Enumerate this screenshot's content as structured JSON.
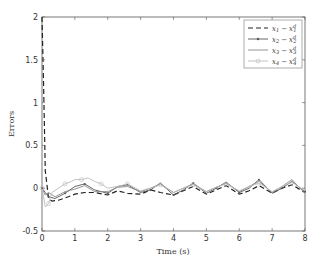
{
  "chart_data": {
    "type": "line",
    "title": "",
    "xlabel": "Time (s)",
    "ylabel": "Errors",
    "xlim": [
      0,
      8
    ],
    "ylim": [
      -0.5,
      2
    ],
    "xticks": [
      0,
      1,
      2,
      3,
      4,
      5,
      6,
      7,
      8
    ],
    "yticks": [
      -0.5,
      0,
      0.5,
      1,
      1.5,
      2
    ],
    "grid": false,
    "legend_position": "upper right",
    "series": [
      {
        "name": "x1 - x1^d",
        "style": "dashed",
        "color": "#222222",
        "x": [
          0,
          0.05,
          0.1,
          0.2,
          0.3,
          0.5,
          0.8,
          1.0,
          1.3,
          1.6,
          2.0,
          2.3,
          2.6,
          3.0,
          3.3,
          3.6,
          4.0,
          4.3,
          4.6,
          5.0,
          5.3,
          5.6,
          6.0,
          6.3,
          6.6,
          7.0,
          7.3,
          7.6,
          8.0
        ],
        "y": [
          2.0,
          1.2,
          0.2,
          -0.12,
          -0.15,
          -0.14,
          -0.1,
          -0.07,
          -0.05,
          -0.05,
          -0.08,
          -0.03,
          -0.06,
          -0.07,
          -0.02,
          -0.05,
          -0.08,
          -0.03,
          0.02,
          -0.07,
          -0.02,
          0.03,
          -0.07,
          -0.03,
          0.03,
          -0.06,
          0.0,
          0.04,
          -0.05
        ]
      },
      {
        "name": "x2 - x2^d",
        "style": "solid-marker",
        "color": "#555555",
        "x": [
          0,
          0.1,
          0.2,
          0.4,
          0.7,
          1.0,
          1.3,
          1.6,
          2.0,
          2.3,
          2.6,
          3.0,
          3.3,
          3.6,
          4.0,
          4.3,
          4.6,
          5.0,
          5.3,
          5.6,
          6.0,
          6.3,
          6.6,
          7.0,
          7.3,
          7.6,
          8.0
        ],
        "y": [
          0.0,
          -0.05,
          -0.1,
          -0.12,
          -0.06,
          0.02,
          0.05,
          -0.02,
          -0.06,
          0.02,
          0.04,
          -0.05,
          -0.02,
          0.06,
          -0.08,
          -0.02,
          0.06,
          -0.06,
          0.0,
          0.07,
          -0.05,
          0.0,
          0.1,
          -0.06,
          0.0,
          0.08,
          -0.04
        ]
      },
      {
        "name": "x3 - x3^d",
        "style": "solid",
        "color": "#888888",
        "x": [
          0,
          0.1,
          0.2,
          0.4,
          0.7,
          1.0,
          1.3,
          1.6,
          2.0,
          2.3,
          2.6,
          3.0,
          3.3,
          3.6,
          4.0,
          4.3,
          4.6,
          5.0,
          5.3,
          5.6,
          6.0,
          6.3,
          6.6,
          7.0,
          7.3,
          7.6,
          8.0
        ],
        "y": [
          0.0,
          -0.08,
          -0.05,
          -0.1,
          -0.04,
          -0.01,
          0.03,
          -0.04,
          -0.04,
          0.01,
          0.02,
          -0.04,
          0.0,
          0.05,
          -0.05,
          0.0,
          0.05,
          -0.04,
          0.01,
          0.06,
          -0.04,
          0.02,
          0.08,
          -0.05,
          0.02,
          0.1,
          -0.06
        ]
      },
      {
        "name": "x4 - x4^d",
        "style": "solid-circle-marker",
        "color": "#bbbbbb",
        "x": [
          0,
          0.05,
          0.1,
          0.2,
          0.3,
          0.5,
          0.7,
          0.9,
          1.0,
          1.2,
          1.4,
          1.6,
          1.8,
          2.0,
          2.3,
          2.6,
          3.0,
          3.3,
          3.6,
          4.0,
          4.3,
          4.6,
          5.0,
          5.3,
          5.6,
          6.0,
          6.3,
          6.6,
          7.0,
          7.3,
          7.6,
          8.0
        ],
        "y": [
          0.0,
          -0.1,
          -0.22,
          -0.18,
          -0.05,
          0.0,
          0.05,
          0.08,
          0.1,
          0.1,
          0.12,
          0.08,
          0.05,
          0.0,
          0.02,
          0.05,
          -0.03,
          0.0,
          0.04,
          -0.05,
          0.0,
          0.04,
          -0.04,
          0.01,
          0.05,
          -0.03,
          0.02,
          0.06,
          -0.04,
          0.02,
          0.07,
          -0.03
        ]
      }
    ]
  },
  "legend": {
    "items": [
      {
        "lhs": "x",
        "lsub": "1",
        "rhs": "x",
        "rsub": "1",
        "rsup": "d"
      },
      {
        "lhs": "x",
        "lsub": "2",
        "rhs": "x",
        "rsub": "2",
        "rsup": "d"
      },
      {
        "lhs": "x",
        "lsub": "3",
        "rhs": "x",
        "rsub": "3",
        "rsup": "d"
      },
      {
        "lhs": "x",
        "lsub": "4",
        "rhs": "x",
        "rsub": "4",
        "rsup": "d"
      }
    ],
    "minus": "−"
  }
}
